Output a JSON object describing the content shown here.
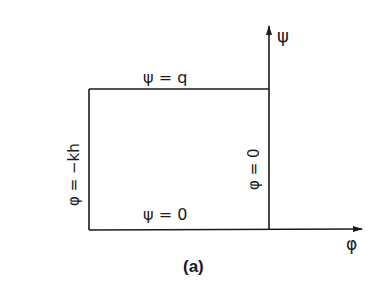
{
  "diagram": {
    "type": "boundary-conditions-rectangle",
    "caption": "(a)",
    "axes": {
      "vertical": {
        "label": "ψ"
      },
      "horizontal": {
        "label": "φ"
      }
    },
    "boundaries": {
      "top": "ψ = q",
      "bottom": "ψ = 0",
      "left": "φ = −kh",
      "right": "φ = 0"
    },
    "colors": {
      "ink": "#1a1a1a",
      "background": "#ffffff"
    }
  }
}
